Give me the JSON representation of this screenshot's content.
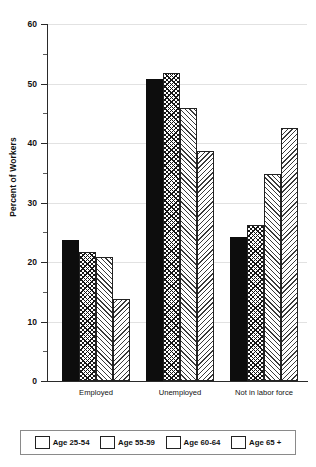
{
  "chart_data": {
    "type": "bar",
    "title": "",
    "subtitle": "",
    "xlabel": "",
    "ylabel": "Percent of Workers",
    "ylim": [
      0,
      60
    ],
    "ytick_labels": [
      "0",
      "10",
      "20",
      "30",
      "40",
      "50",
      "60"
    ],
    "ytick_values": [
      0,
      10,
      20,
      30,
      40,
      50,
      60
    ],
    "yminor_values": [
      5,
      15,
      25,
      35,
      45,
      55
    ],
    "grid": true,
    "grid_axis": "y",
    "legend_position": "bottom",
    "categories": [
      "Employed",
      "Unemployed",
      "Not in labor force"
    ],
    "series": [
      {
        "name": "Age 25-54",
        "pattern": "solid",
        "values": [
          23.7,
          50.8,
          24.2
        ]
      },
      {
        "name": "Age 55-59",
        "pattern": "crosshatch",
        "values": [
          21.6,
          51.7,
          26.3
        ]
      },
      {
        "name": "Age 60-64",
        "pattern": "forward-diagonal",
        "values": [
          20.8,
          45.8,
          34.8
        ]
      },
      {
        "name": "Age 65 +",
        "pattern": "backward-diagonal",
        "values": [
          13.8,
          38.7,
          42.6
        ]
      }
    ]
  },
  "legend": {
    "items": [
      {
        "label": "Age 25-54"
      },
      {
        "label": "Age 55-59"
      },
      {
        "label": "Age 60-64"
      },
      {
        "label": "Age 65 +"
      }
    ]
  },
  "colors": {
    "bar_solid": "#0d0d0d",
    "bar_outline": "#222222",
    "axis": "#2a2a2a",
    "gridline": "#e2e2e2",
    "background": "#ffffff"
  }
}
